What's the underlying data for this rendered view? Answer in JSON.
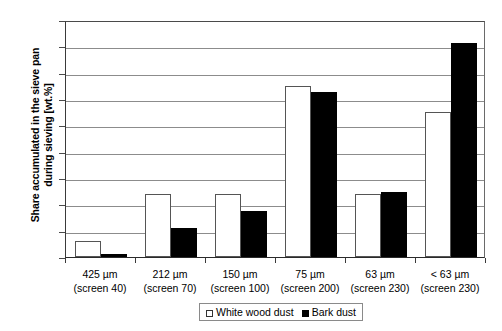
{
  "chart_data": {
    "type": "bar",
    "title": "",
    "xlabel": "",
    "ylabel": "Share accumulated in the sieve pan during sieving [wt.%]",
    "ylabel_lines": [
      "Share accumulated in the sieve pan",
      "during sieving [wt.%]"
    ],
    "ylim": [
      0,
      45
    ],
    "ytick_step": 5,
    "yticks": [
      0,
      5,
      10,
      15,
      20,
      25,
      30,
      35,
      40,
      45
    ],
    "grid": true,
    "grid_axis": "y",
    "legend_position": "bottom-center",
    "categories": [
      "425 µm (screen 40)",
      "212 µm (screen 70)",
      "150 µm (screen 100)",
      "75 µm (screen 200)",
      "63 µm (screen 230)",
      "< 63 µm (screen 230)"
    ],
    "category_lines": [
      {
        "l1": "425 µm",
        "l2": "(screen 40)"
      },
      {
        "l1": "212 µm",
        "l2": "(screen 70)"
      },
      {
        "l1": "150 µm",
        "l2": "(screen 100)"
      },
      {
        "l1": "75 µm",
        "l2": "(screen 200)"
      },
      {
        "l1": "63 µm",
        "l2": "(screen 230)"
      },
      {
        "l1": "< 63 µm",
        "l2": "(screen 230)"
      }
    ],
    "series": [
      {
        "name": "White wood dust",
        "style": "open-square",
        "color": "#ffffff",
        "border_color": "#555555",
        "values": [
          3.0,
          11.9,
          12.0,
          32.5,
          11.9,
          27.5
        ]
      },
      {
        "name": "Bark dust",
        "style": "filled-square",
        "color": "#000000",
        "border_color": "#000000",
        "values": [
          0.5,
          5.5,
          8.7,
          31.3,
          12.3,
          40.7
        ]
      }
    ]
  },
  "legend": {
    "entries": [
      {
        "label": "White wood dust",
        "swatch": "open-square"
      },
      {
        "label": "Bark dust",
        "swatch": "filled-square"
      }
    ]
  }
}
